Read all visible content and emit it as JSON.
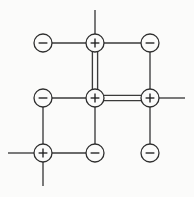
{
  "diagram": {
    "canvas": {
      "width": 194,
      "height": 197
    },
    "colors": {
      "background": "#fbfbfa",
      "line": "#3a3a3a",
      "node_stroke": "#2e2e2e",
      "node_fill": "#fbfbfa",
      "sign": "#1e1e1e"
    },
    "node_radius": 9,
    "grid": {
      "columns_x": [
        43,
        95,
        150
      ],
      "rows_y": [
        43,
        98,
        153
      ]
    },
    "nodes": [
      {
        "id": "n-top-left",
        "sign": "−",
        "label": "minus",
        "x": 43,
        "y": 43,
        "row": 0,
        "col": 0
      },
      {
        "id": "n-top-center",
        "sign": "+",
        "label": "plus",
        "x": 95,
        "y": 43,
        "row": 0,
        "col": 1
      },
      {
        "id": "n-top-right",
        "sign": "−",
        "label": "minus",
        "x": 150,
        "y": 43,
        "row": 0,
        "col": 2
      },
      {
        "id": "n-mid-left",
        "sign": "−",
        "label": "minus",
        "x": 43,
        "y": 98,
        "row": 1,
        "col": 0
      },
      {
        "id": "n-mid-center",
        "sign": "+",
        "label": "plus",
        "x": 95,
        "y": 98,
        "row": 1,
        "col": 1
      },
      {
        "id": "n-mid-right",
        "sign": "+",
        "label": "plus",
        "x": 150,
        "y": 98,
        "row": 1,
        "col": 2
      },
      {
        "id": "n-bottom-left",
        "sign": "+",
        "label": "plus",
        "x": 43,
        "y": 153,
        "row": 2,
        "col": 0
      },
      {
        "id": "n-bottom-center",
        "sign": "−",
        "label": "minus",
        "x": 95,
        "y": 153,
        "row": 2,
        "col": 1
      },
      {
        "id": "n-bottom-right",
        "sign": "−",
        "label": "minus",
        "x": 150,
        "y": 153,
        "row": 2,
        "col": 2
      }
    ],
    "bonds": [
      {
        "id": "b-tl-tc",
        "from": "n-top-left",
        "to": "n-top-center",
        "order": 1,
        "orientation": "horizontal"
      },
      {
        "id": "b-tc-tr",
        "from": "n-top-center",
        "to": "n-top-right",
        "order": 1,
        "orientation": "horizontal"
      },
      {
        "id": "b-tc-mc",
        "from": "n-top-center",
        "to": "n-mid-center",
        "order": 2,
        "orientation": "vertical"
      },
      {
        "id": "b-tr-mr",
        "from": "n-top-right",
        "to": "n-mid-right",
        "order": 1,
        "orientation": "vertical"
      },
      {
        "id": "b-ml-mc",
        "from": "n-mid-left",
        "to": "n-mid-center",
        "order": 1,
        "orientation": "horizontal"
      },
      {
        "id": "b-mc-mr",
        "from": "n-mid-center",
        "to": "n-mid-right",
        "order": 2,
        "orientation": "horizontal"
      },
      {
        "id": "b-ml-bl",
        "from": "n-mid-left",
        "to": "n-bottom-left",
        "order": 1,
        "orientation": "vertical"
      },
      {
        "id": "b-mc-bc",
        "from": "n-mid-center",
        "to": "n-bottom-center",
        "order": 1,
        "orientation": "vertical"
      },
      {
        "id": "b-mr-br",
        "from": "n-mid-right",
        "to": "n-bottom-right",
        "order": 1,
        "orientation": "vertical"
      },
      {
        "id": "b-bl-bc",
        "from": "n-bottom-left",
        "to": "n-bottom-center",
        "order": 1,
        "orientation": "horizontal"
      }
    ],
    "stubs": [
      {
        "id": "s-top-center-up",
        "from": "n-top-center",
        "direction": "up",
        "end_x": 95,
        "end_y": 10
      },
      {
        "id": "s-mid-right-right",
        "from": "n-mid-right",
        "direction": "right",
        "end_x": 185,
        "end_y": 98
      },
      {
        "id": "s-bottom-left-left",
        "from": "n-bottom-left",
        "direction": "left",
        "end_x": 8,
        "end_y": 153
      },
      {
        "id": "s-bottom-left-down",
        "from": "n-bottom-left",
        "direction": "down",
        "end_x": 43,
        "end_y": 186
      }
    ]
  }
}
